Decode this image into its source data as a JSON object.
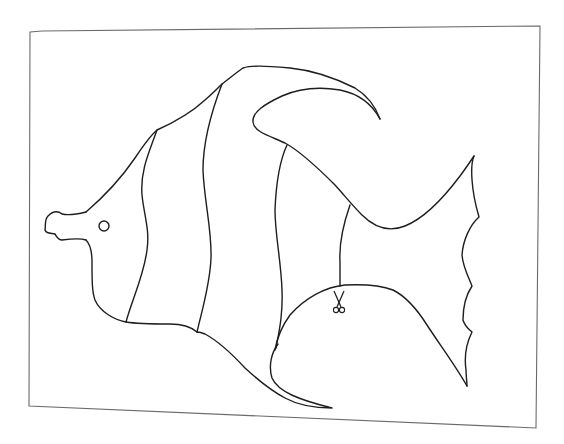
{
  "page": {
    "colors": {
      "background": "#ffffff",
      "outline": "#1e1e1e",
      "frame": "#6a6a6a"
    }
  },
  "drawing": {
    "subject": "angelfish",
    "parts": [
      "frame",
      "body-outline",
      "mouth",
      "eye",
      "dorsal-fin",
      "tail-fin",
      "anal-fin",
      "pelvic-fin",
      "stripe-1",
      "stripe-2",
      "stripe-3",
      "stripe-4"
    ],
    "icons": [
      "scissors-icon"
    ]
  }
}
